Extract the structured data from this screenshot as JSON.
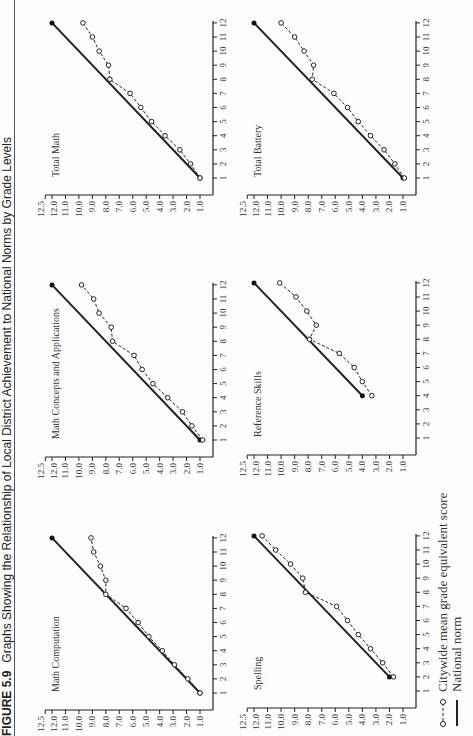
{
  "figure": {
    "number": "FIGURE 5.9",
    "title": "Graphs Showing the Relationship of Local District Achievement to National Norms by Grade Levels",
    "orientation": "rotated -90deg (landscape page)"
  },
  "legend": {
    "citywide": "Citywide mean grade equivalent score",
    "national": "National norm"
  },
  "colors": {
    "line": "#222222",
    "marker_fill": "#ffffff",
    "norm_dot": "#111111"
  },
  "axis": {
    "y_ticks": [
      "1.0",
      "2.0",
      "3.0",
      "4.0",
      "5.0",
      "6.0",
      "7.0",
      "8.0",
      "9.0",
      "10.0",
      "11.0",
      "12.0",
      "12.5"
    ],
    "x_ticks": [
      "1",
      "2",
      "3",
      "4",
      "5",
      "6",
      "7",
      "8",
      "9",
      "10",
      "11",
      "12"
    ]
  },
  "chart_data": [
    {
      "type": "line",
      "title": "Math Computation",
      "xlabel": "Grade",
      "ylabel": "Grade equivalent score",
      "x": [
        1,
        2,
        3,
        4,
        5,
        6,
        7,
        8,
        9,
        10,
        11,
        12
      ],
      "ylim": [
        1.0,
        12.5
      ],
      "series": [
        {
          "name": "Citywide mean grade equivalent score",
          "values": [
            1.0,
            1.9,
            2.9,
            3.8,
            4.8,
            5.6,
            6.5,
            8.0,
            8.0,
            8.4,
            8.9,
            9.1
          ]
        },
        {
          "name": "National norm",
          "x": [
            1,
            12
          ],
          "values": [
            1.0,
            12.0
          ]
        }
      ]
    },
    {
      "type": "line",
      "title": "Math Concepts and Applications",
      "xlabel": "Grade",
      "ylabel": "Grade equivalent score",
      "x": [
        1,
        2,
        3,
        4,
        5,
        6,
        7,
        8,
        9,
        10,
        11,
        12
      ],
      "ylim": [
        1.0,
        12.5
      ],
      "series": [
        {
          "name": "Citywide mean grade equivalent score",
          "values": [
            0.8,
            1.6,
            2.3,
            3.4,
            4.5,
            5.3,
            5.9,
            7.5,
            7.6,
            8.5,
            8.9,
            9.8
          ]
        },
        {
          "name": "National norm",
          "x": [
            1,
            12
          ],
          "values": [
            1.0,
            12.0
          ]
        }
      ]
    },
    {
      "type": "line",
      "title": "Total Math",
      "xlabel": "Grade",
      "ylabel": "Grade equivalent score",
      "x": [
        1,
        2,
        3,
        4,
        5,
        6,
        7,
        8,
        9,
        10,
        11,
        12
      ],
      "ylim": [
        1.0,
        12.5
      ],
      "series": [
        {
          "name": "Citywide mean grade equivalent score",
          "values": [
            1.0,
            1.7,
            2.5,
            3.6,
            4.6,
            5.4,
            6.2,
            7.7,
            7.8,
            8.5,
            9.0,
            9.7
          ]
        },
        {
          "name": "National norm",
          "x": [
            1,
            12
          ],
          "values": [
            1.0,
            12.0
          ]
        }
      ]
    },
    {
      "type": "line",
      "title": "Spelling",
      "xlabel": "Grade",
      "ylabel": "Grade equivalent score",
      "x": [
        2,
        3,
        4,
        5,
        6,
        7,
        8,
        9,
        10,
        11,
        12
      ],
      "ylim": [
        1.0,
        12.5
      ],
      "series": [
        {
          "name": "Citywide mean grade equivalent score",
          "values": [
            1.7,
            2.5,
            3.4,
            4.3,
            5.1,
            5.9,
            8.2,
            8.4,
            9.3,
            10.4,
            11.4
          ]
        },
        {
          "name": "National norm",
          "x": [
            2,
            12
          ],
          "values": [
            2.0,
            12.0
          ]
        }
      ]
    },
    {
      "type": "line",
      "title": "Reference Skills",
      "xlabel": "Grade",
      "ylabel": "Grade equivalent score",
      "x": [
        4,
        5,
        6,
        7,
        8,
        9,
        10,
        11,
        12
      ],
      "ylim": [
        1.0,
        12.5
      ],
      "series": [
        {
          "name": "Citywide mean grade equivalent score",
          "values": [
            3.3,
            4.0,
            4.6,
            5.7,
            7.9,
            7.4,
            8.1,
            8.9,
            10.1
          ]
        },
        {
          "name": "National norm",
          "x": [
            4,
            12
          ],
          "values": [
            4.0,
            12.0
          ]
        }
      ]
    },
    {
      "type": "line",
      "title": "Total Battery",
      "xlabel": "Grade",
      "ylabel": "Grade equivalent score",
      "x": [
        1,
        2,
        3,
        4,
        5,
        6,
        7,
        8,
        9,
        10,
        11,
        12
      ],
      "ylim": [
        1.0,
        12.5
      ],
      "series": [
        {
          "name": "Citywide mean grade equivalent score",
          "values": [
            0.9,
            1.6,
            2.4,
            3.4,
            4.3,
            5.1,
            6.1,
            7.7,
            7.6,
            8.3,
            9.0,
            10.0
          ]
        },
        {
          "name": "National norm",
          "x": [
            1,
            12
          ],
          "values": [
            1.0,
            12.0
          ]
        }
      ]
    }
  ],
  "layout": {
    "panels": [
      {
        "x0": 43,
        "y_one": 200,
        "y_twelve": 52
      },
      {
        "x0": 296,
        "y_one": 200,
        "y_twelve": 52
      },
      {
        "x0": 558,
        "y_one": 200,
        "y_twelve": 52
      },
      {
        "x0": 45,
        "y_one": 403,
        "y_twelve": 254
      },
      {
        "x0": 298,
        "y_one": 403,
        "y_twelve": 254
      },
      {
        "x0": 558,
        "y_one": 403,
        "y_twelve": 254
      }
    ],
    "grade_step": 14.1
  }
}
